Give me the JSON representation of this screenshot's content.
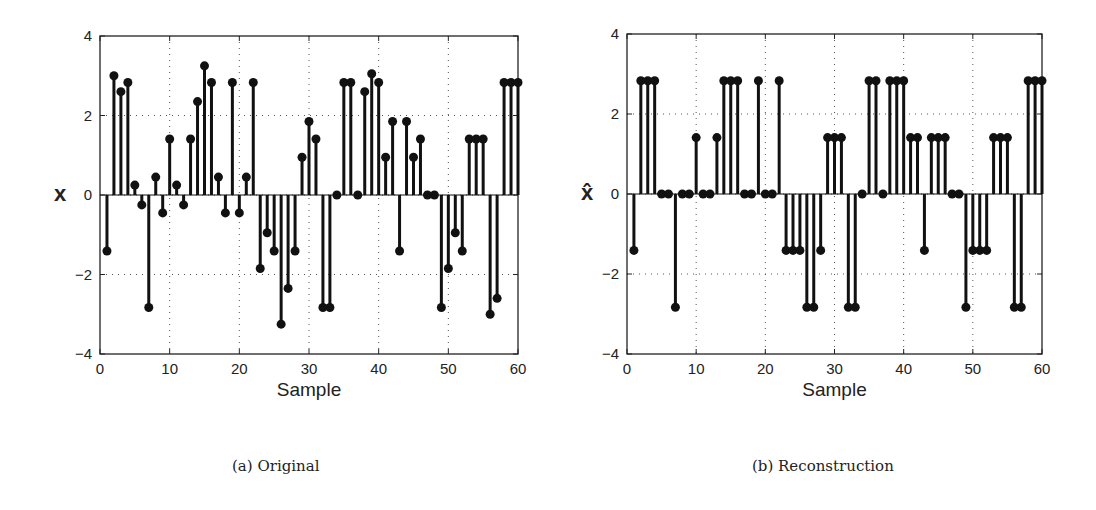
{
  "chart_data": [
    {
      "type": "stem",
      "title": "",
      "caption": "(a) Original",
      "xlabel": "Sample",
      "ylabel": "x",
      "xlim": [
        0,
        60
      ],
      "ylim": [
        -4,
        4
      ],
      "xticks": [
        0,
        10,
        20,
        30,
        40,
        50,
        60
      ],
      "yticks": [
        -4,
        -2,
        0,
        2,
        4
      ],
      "grid": true,
      "x": [
        1,
        2,
        3,
        4,
        5,
        6,
        7,
        8,
        9,
        10,
        11,
        12,
        13,
        14,
        15,
        16,
        17,
        18,
        19,
        20,
        21,
        22,
        23,
        24,
        25,
        26,
        27,
        28,
        29,
        30,
        31,
        32,
        33,
        34,
        35,
        36,
        37,
        38,
        39,
        40,
        41,
        42,
        43,
        44,
        45,
        46,
        47,
        48,
        49,
        50,
        51,
        52,
        53,
        54,
        55,
        56,
        57,
        58,
        59,
        60
      ],
      "values": [
        -1.41,
        3.0,
        2.6,
        2.83,
        0.25,
        -0.25,
        -2.83,
        0.45,
        -0.45,
        1.41,
        0.25,
        -0.25,
        1.41,
        2.35,
        3.25,
        2.83,
        0.45,
        -0.45,
        2.83,
        -0.45,
        0.45,
        2.83,
        -1.85,
        -0.95,
        -1.41,
        -3.25,
        -2.35,
        -1.41,
        0.95,
        1.85,
        1.41,
        -2.83,
        -2.83,
        0,
        2.83,
        2.83,
        0,
        2.6,
        3.05,
        2.83,
        0.95,
        1.85,
        -1.41,
        1.85,
        0.95,
        1.41,
        0,
        0,
        -2.83,
        -1.85,
        -0.95,
        -1.41,
        1.41,
        1.41,
        1.41,
        -3.0,
        -2.6,
        2.83,
        2.83,
        2.83
      ]
    },
    {
      "type": "stem",
      "title": "",
      "caption": "(b) Reconstruction",
      "xlabel": "Sample",
      "ylabel": "x̂",
      "xlim": [
        0,
        60
      ],
      "ylim": [
        -4,
        4
      ],
      "xticks": [
        0,
        10,
        20,
        30,
        40,
        50,
        60
      ],
      "yticks": [
        -4,
        -2,
        0,
        2,
        4
      ],
      "grid": true,
      "x": [
        1,
        2,
        3,
        4,
        5,
        6,
        7,
        8,
        9,
        10,
        11,
        12,
        13,
        14,
        15,
        16,
        17,
        18,
        19,
        20,
        21,
        22,
        23,
        24,
        25,
        26,
        27,
        28,
        29,
        30,
        31,
        32,
        33,
        34,
        35,
        36,
        37,
        38,
        39,
        40,
        41,
        42,
        43,
        44,
        45,
        46,
        47,
        48,
        49,
        50,
        51,
        52,
        53,
        54,
        55,
        56,
        57,
        58,
        59,
        60
      ],
      "values": [
        -1.41,
        2.83,
        2.83,
        2.83,
        0,
        0,
        -2.83,
        0,
        0,
        1.41,
        0,
        0,
        1.41,
        2.83,
        2.83,
        2.83,
        0,
        0,
        2.83,
        0,
        0,
        2.83,
        -1.41,
        -1.41,
        -1.41,
        -2.83,
        -2.83,
        -1.41,
        1.41,
        1.41,
        1.41,
        -2.83,
        -2.83,
        0,
        2.83,
        2.83,
        0,
        2.83,
        2.83,
        2.83,
        1.41,
        1.41,
        -1.41,
        1.41,
        1.41,
        1.41,
        0,
        0,
        -2.83,
        -1.41,
        -1.41,
        -1.41,
        1.41,
        1.41,
        1.41,
        -2.83,
        -2.83,
        2.83,
        2.83,
        2.83
      ]
    }
  ],
  "captions": {
    "a": "(a) Original",
    "b": "(b) Reconstruction"
  },
  "axes": {
    "xlabel": "Sample",
    "ylabel_a": "x",
    "ylabel_b": "x̂"
  }
}
